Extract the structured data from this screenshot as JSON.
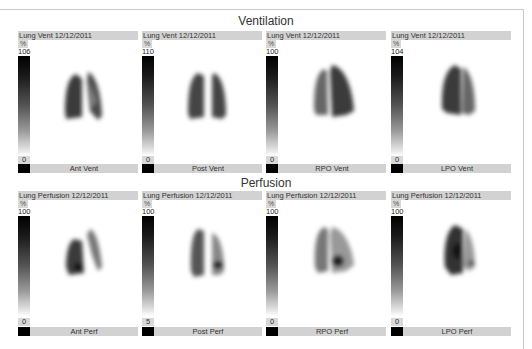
{
  "sections": [
    {
      "title": "Ventilation",
      "panels": [
        {
          "header": "Lung Vent 12/12/2011",
          "unit": "%",
          "max": "106",
          "min": "0",
          "label": "Ant Vent"
        },
        {
          "header": "Lung Vent 12/12/2011",
          "unit": "%",
          "max": "110",
          "min": "0",
          "label": "Post Vent"
        },
        {
          "header": "Lung Vent 12/12/2011",
          "unit": "%",
          "max": "100",
          "min": "0",
          "label": "RPO Vent"
        },
        {
          "header": "Lung Vent 12/12/2011",
          "unit": "%",
          "max": "104",
          "min": "0",
          "label": "LPO Vent"
        }
      ]
    },
    {
      "title": "Perfusion",
      "panels": [
        {
          "header": "Lung Perfusion 12/12/2011",
          "unit": "%",
          "max": "100",
          "min": "0",
          "label": "Ant Perf"
        },
        {
          "header": "Lung Perfusion 12/12/2011",
          "unit": "%",
          "max": "100",
          "min": "5",
          "label": "Post Perf"
        },
        {
          "header": "Lung Perfusion 12/12/2011",
          "unit": "%",
          "max": "100",
          "min": "0",
          "label": "RPO Perf"
        },
        {
          "header": "Lung Perfusion 12/12/2011",
          "unit": "%",
          "max": "100",
          "min": "0",
          "label": "LPO Perf"
        }
      ]
    }
  ],
  "colors": {
    "header_bg": "#d2d2d2",
    "scale_top": "#000000",
    "scale_bottom": "#ffffff"
  }
}
